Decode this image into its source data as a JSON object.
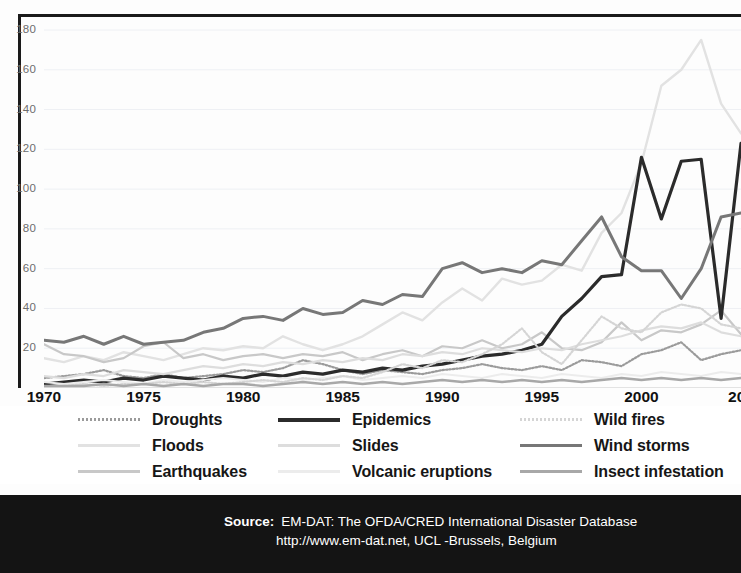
{
  "chart_data": {
    "type": "line",
    "title": "",
    "subtitle": "",
    "xlabel": "",
    "ylabel": "",
    "xlim": [
      1970,
      2005
    ],
    "ylim": [
      0,
      180
    ],
    "yticks": [
      20,
      40,
      60,
      80,
      100,
      120,
      140,
      160,
      180
    ],
    "xticks": [
      1970,
      1975,
      1980,
      1985,
      1990,
      1995,
      2000,
      2005
    ],
    "xtick_labels": [
      "1970",
      "1975",
      "1980",
      "1985",
      "1990",
      "1995",
      "2000",
      "200"
    ],
    "grid": "horizontal",
    "legend_position": "below-plot",
    "x": [
      1970,
      1971,
      1972,
      1973,
      1974,
      1975,
      1976,
      1977,
      1978,
      1979,
      1980,
      1981,
      1982,
      1983,
      1984,
      1985,
      1986,
      1987,
      1988,
      1989,
      1990,
      1991,
      1992,
      1993,
      1994,
      1995,
      1996,
      1997,
      1998,
      1999,
      2000,
      2001,
      2002,
      2003,
      2004,
      2005
    ],
    "series": [
      {
        "name": "Droughts",
        "color": "#9b9b9b",
        "style": "dotted",
        "width": 2.2,
        "values": [
          5,
          6,
          7,
          9,
          6,
          5,
          7,
          5,
          6,
          7,
          9,
          8,
          10,
          14,
          12,
          9,
          7,
          9,
          8,
          7,
          9,
          10,
          12,
          10,
          9,
          11,
          9,
          14,
          13,
          11,
          17,
          19,
          23,
          14,
          17,
          19
        ]
      },
      {
        "name": "Floods",
        "color": "#e2e2e2",
        "style": "solid",
        "width": 2.4,
        "values": [
          15,
          13,
          16,
          14,
          18,
          16,
          14,
          17,
          20,
          19,
          21,
          20,
          26,
          22,
          19,
          22,
          26,
          32,
          38,
          34,
          43,
          50,
          44,
          55,
          52,
          54,
          62,
          59,
          78,
          88,
          113,
          152,
          160,
          175,
          143,
          128
        ]
      },
      {
        "name": "Earthquakes",
        "color": "#c8c8c8",
        "style": "solid",
        "width": 2.2,
        "values": [
          22,
          17,
          16,
          13,
          15,
          21,
          23,
          15,
          17,
          14,
          16,
          17,
          15,
          17,
          16,
          18,
          14,
          17,
          19,
          16,
          21,
          20,
          24,
          20,
          22,
          28,
          20,
          19,
          23,
          33,
          24,
          29,
          28,
          32,
          39,
          27
        ]
      },
      {
        "name": "Epidemics",
        "color": "#2b2b2b",
        "style": "solid",
        "width": 3.2,
        "values": [
          2,
          3,
          4,
          3,
          5,
          4,
          6,
          5,
          4,
          6,
          5,
          7,
          6,
          8,
          7,
          9,
          8,
          10,
          9,
          11,
          12,
          14,
          16,
          17,
          19,
          22,
          36,
          45,
          56,
          57,
          116,
          85,
          114,
          115,
          35,
          123
        ]
      },
      {
        "name": "Slides",
        "color": "#dddddd",
        "style": "solid",
        "width": 2.2,
        "values": [
          6,
          5,
          7,
          6,
          9,
          8,
          7,
          9,
          11,
          10,
          12,
          11,
          13,
          12,
          14,
          13,
          15,
          14,
          17,
          16,
          18,
          17,
          20,
          19,
          18,
          20,
          19,
          22,
          24,
          26,
          29,
          31,
          30,
          33,
          28,
          26
        ]
      },
      {
        "name": "Volcanic eruptions",
        "color": "#ececec",
        "style": "solid",
        "width": 2.0,
        "values": [
          3,
          2,
          3,
          4,
          3,
          2,
          4,
          3,
          4,
          5,
          4,
          3,
          5,
          4,
          5,
          6,
          4,
          5,
          6,
          5,
          7,
          6,
          5,
          7,
          6,
          5,
          7,
          6,
          5,
          7,
          6,
          8,
          7,
          6,
          8,
          7
        ]
      },
      {
        "name": "Wild fires",
        "color": "#d5d5d5",
        "style": "dotted",
        "width": 2.2,
        "values": [
          1,
          1,
          2,
          1,
          2,
          2,
          3,
          2,
          3,
          2,
          3,
          4,
          3,
          5,
          4,
          6,
          5,
          8,
          12,
          10,
          14,
          13,
          17,
          22,
          30,
          18,
          12,
          24,
          36,
          30,
          28,
          38,
          42,
          40,
          32,
          30
        ]
      },
      {
        "name": "Wind storms",
        "color": "#777777",
        "style": "solid",
        "width": 3.0,
        "values": [
          24,
          23,
          26,
          22,
          26,
          22,
          23,
          24,
          28,
          30,
          35,
          36,
          34,
          40,
          37,
          38,
          44,
          42,
          47,
          46,
          60,
          63,
          58,
          60,
          58,
          64,
          62,
          74,
          86,
          66,
          59,
          59,
          45,
          60,
          86,
          88
        ]
      },
      {
        "name": "Insect infestation",
        "color": "#a8a8a8",
        "style": "solid",
        "width": 2.4,
        "values": [
          1,
          1,
          1,
          2,
          1,
          2,
          1,
          2,
          1,
          2,
          2,
          1,
          2,
          3,
          2,
          3,
          2,
          3,
          2,
          3,
          4,
          3,
          4,
          3,
          4,
          3,
          4,
          3,
          4,
          5,
          4,
          5,
          4,
          5,
          4,
          5
        ]
      }
    ]
  },
  "legend": {
    "columns": [
      {
        "entries": [
          {
            "label": "Droughts",
            "color": "#9b9b9b",
            "style": "dotted"
          },
          {
            "label": "Floods",
            "color": "#e2e2e2",
            "style": "solid"
          },
          {
            "label": "Earthquakes",
            "color": "#c8c8c8",
            "style": "solid"
          }
        ]
      },
      {
        "entries": [
          {
            "label": "Epidemics",
            "color": "#2b2b2b",
            "style": "solid"
          },
          {
            "label": "Slides",
            "color": "#dddddd",
            "style": "solid"
          },
          {
            "label": "Volcanic eruptions",
            "color": "#ececec",
            "style": "solid"
          }
        ]
      },
      {
        "entries": [
          {
            "label": "Wild fires",
            "color": "#d5d5d5",
            "style": "dotted"
          },
          {
            "label": "Wind storms",
            "color": "#777777",
            "style": "solid"
          },
          {
            "label": "Insect infestation",
            "color": "#a8a8a8",
            "style": "solid"
          }
        ]
      }
    ]
  },
  "source": {
    "label": "Source:",
    "line1": "EM-DAT: The OFDA/CRED International Disaster Database",
    "line2": "http://www.em-dat.net, UCL -Brussels, Belgium"
  }
}
